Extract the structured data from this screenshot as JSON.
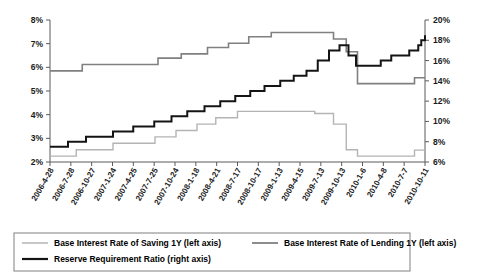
{
  "chart_data": {
    "type": "line",
    "title": "",
    "xlabel": "",
    "ylabel": "",
    "grid": false,
    "legend_position": "bottom",
    "x": [
      "2006-4-28",
      "2006-7-28",
      "2006-10-27",
      "2007-1-24",
      "2007-4-25",
      "2007-7-25",
      "2007-10-24",
      "2008-1-18",
      "2008-4-21",
      "2008-7-17",
      "2008-10-17",
      "2009-1-13",
      "2009-4-15",
      "2009-7-13",
      "2009-10-13",
      "2010-1-6",
      "2010-4-8",
      "2010-7-7",
      "2010-10-11"
    ],
    "left_axis": {
      "ticks": [
        "2%",
        "3%",
        "4%",
        "5%",
        "6%",
        "7%",
        "8%"
      ],
      "values": [
        2,
        3,
        4,
        5,
        6,
        7,
        8
      ],
      "ylim": [
        2,
        8
      ]
    },
    "right_axis": {
      "ticks": [
        "6%",
        "8%",
        "10%",
        "12%",
        "14%",
        "16%",
        "18%",
        "20%"
      ],
      "values": [
        6,
        8,
        10,
        12,
        14,
        16,
        18,
        20
      ],
      "ylim": [
        6,
        20
      ]
    },
    "series": [
      {
        "name": "Base Interest Rate of Saving 1Y (left axis)",
        "axis": "left",
        "color": "#b4b4b4",
        "width": 1.4,
        "step": true,
        "points": [
          {
            "t": 0.0,
            "v": 2.25
          },
          {
            "t": 0.042,
            "v": 2.25
          },
          {
            "t": 0.07,
            "v": 2.52
          },
          {
            "t": 0.14,
            "v": 2.52
          },
          {
            "t": 0.168,
            "v": 2.79
          },
          {
            "t": 0.255,
            "v": 2.79
          },
          {
            "t": 0.28,
            "v": 3.06
          },
          {
            "t": 0.31,
            "v": 3.06
          },
          {
            "t": 0.336,
            "v": 3.33
          },
          {
            "t": 0.37,
            "v": 3.33
          },
          {
            "t": 0.392,
            "v": 3.6
          },
          {
            "t": 0.42,
            "v": 3.6
          },
          {
            "t": 0.442,
            "v": 3.87
          },
          {
            "t": 0.476,
            "v": 3.87
          },
          {
            "t": 0.5,
            "v": 4.14
          },
          {
            "t": 0.69,
            "v": 4.14
          },
          {
            "t": 0.706,
            "v": 4.05
          },
          {
            "t": 0.74,
            "v": 4.05
          },
          {
            "t": 0.756,
            "v": 3.6
          },
          {
            "t": 0.774,
            "v": 3.6
          },
          {
            "t": 0.79,
            "v": 2.52
          },
          {
            "t": 0.806,
            "v": 2.52
          },
          {
            "t": 0.82,
            "v": 2.25
          },
          {
            "t": 0.958,
            "v": 2.25
          },
          {
            "t": 0.972,
            "v": 2.5
          },
          {
            "t": 1.0,
            "v": 2.5
          }
        ]
      },
      {
        "name": "Base Interest Rate of Lending 1Y (left axis)",
        "axis": "left",
        "color": "#808080",
        "width": 1.6,
        "step": true,
        "points": [
          {
            "t": 0.0,
            "v": 5.85
          },
          {
            "t": 0.068,
            "v": 5.85
          },
          {
            "t": 0.086,
            "v": 6.12
          },
          {
            "t": 0.272,
            "v": 6.12
          },
          {
            "t": 0.288,
            "v": 6.39
          },
          {
            "t": 0.33,
            "v": 6.39
          },
          {
            "t": 0.35,
            "v": 6.57
          },
          {
            "t": 0.404,
            "v": 6.57
          },
          {
            "t": 0.42,
            "v": 6.84
          },
          {
            "t": 0.458,
            "v": 6.84
          },
          {
            "t": 0.476,
            "v": 7.02
          },
          {
            "t": 0.512,
            "v": 7.02
          },
          {
            "t": 0.53,
            "v": 7.29
          },
          {
            "t": 0.572,
            "v": 7.29
          },
          {
            "t": 0.59,
            "v": 7.47
          },
          {
            "t": 0.742,
            "v": 7.47
          },
          {
            "t": 0.756,
            "v": 7.2
          },
          {
            "t": 0.776,
            "v": 7.2
          },
          {
            "t": 0.79,
            "v": 6.66
          },
          {
            "t": 0.806,
            "v": 6.66
          },
          {
            "t": 0.82,
            "v": 5.31
          },
          {
            "t": 0.958,
            "v": 5.31
          },
          {
            "t": 0.972,
            "v": 5.56
          },
          {
            "t": 1.0,
            "v": 5.56
          }
        ]
      },
      {
        "name": "Reserve Requirement Ratio (right axis)",
        "axis": "right",
        "color": "#141414",
        "width": 2.0,
        "step": true,
        "points": [
          {
            "t": 0.0,
            "v": 7.5
          },
          {
            "t": 0.03,
            "v": 7.5
          },
          {
            "t": 0.048,
            "v": 8.0
          },
          {
            "t": 0.078,
            "v": 8.0
          },
          {
            "t": 0.096,
            "v": 8.5
          },
          {
            "t": 0.15,
            "v": 8.5
          },
          {
            "t": 0.168,
            "v": 9.0
          },
          {
            "t": 0.204,
            "v": 9.0
          },
          {
            "t": 0.222,
            "v": 9.5
          },
          {
            "t": 0.262,
            "v": 9.5
          },
          {
            "t": 0.278,
            "v": 10.0
          },
          {
            "t": 0.306,
            "v": 10.0
          },
          {
            "t": 0.324,
            "v": 10.5
          },
          {
            "t": 0.348,
            "v": 10.5
          },
          {
            "t": 0.366,
            "v": 11.0
          },
          {
            "t": 0.396,
            "v": 11.0
          },
          {
            "t": 0.412,
            "v": 11.5
          },
          {
            "t": 0.438,
            "v": 11.5
          },
          {
            "t": 0.454,
            "v": 12.0
          },
          {
            "t": 0.478,
            "v": 12.0
          },
          {
            "t": 0.494,
            "v": 12.5
          },
          {
            "t": 0.518,
            "v": 12.5
          },
          {
            "t": 0.534,
            "v": 13.0
          },
          {
            "t": 0.556,
            "v": 13.0
          },
          {
            "t": 0.572,
            "v": 13.5
          },
          {
            "t": 0.598,
            "v": 13.5
          },
          {
            "t": 0.614,
            "v": 14.0
          },
          {
            "t": 0.634,
            "v": 14.0
          },
          {
            "t": 0.65,
            "v": 14.5
          },
          {
            "t": 0.668,
            "v": 14.5
          },
          {
            "t": 0.684,
            "v": 15.0
          },
          {
            "t": 0.7,
            "v": 15.0
          },
          {
            "t": 0.714,
            "v": 16.0
          },
          {
            "t": 0.73,
            "v": 16.0
          },
          {
            "t": 0.744,
            "v": 17.0
          },
          {
            "t": 0.762,
            "v": 17.0
          },
          {
            "t": 0.772,
            "v": 17.5
          },
          {
            "t": 0.786,
            "v": 17.5
          },
          {
            "t": 0.796,
            "v": 16.5
          },
          {
            "t": 0.806,
            "v": 16.5
          },
          {
            "t": 0.816,
            "v": 15.5
          },
          {
            "t": 0.87,
            "v": 15.5
          },
          {
            "t": 0.882,
            "v": 16.0
          },
          {
            "t": 0.898,
            "v": 16.0
          },
          {
            "t": 0.91,
            "v": 16.5
          },
          {
            "t": 0.948,
            "v": 16.5
          },
          {
            "t": 0.958,
            "v": 17.0
          },
          {
            "t": 0.974,
            "v": 17.0
          },
          {
            "t": 0.982,
            "v": 17.5
          },
          {
            "t": 0.99,
            "v": 18.0
          },
          {
            "t": 1.0,
            "v": 18.5
          }
        ]
      }
    ]
  },
  "legend": {
    "entries": [
      {
        "label": "Base Interest Rate of Saving 1Y (left axis)",
        "color": "#b4b4b4"
      },
      {
        "label": "Base Interest Rate of Lending 1Y (left axis)",
        "color": "#808080"
      },
      {
        "label": "Reserve Requirement Ratio (right axis)",
        "color": "#141414"
      }
    ]
  }
}
